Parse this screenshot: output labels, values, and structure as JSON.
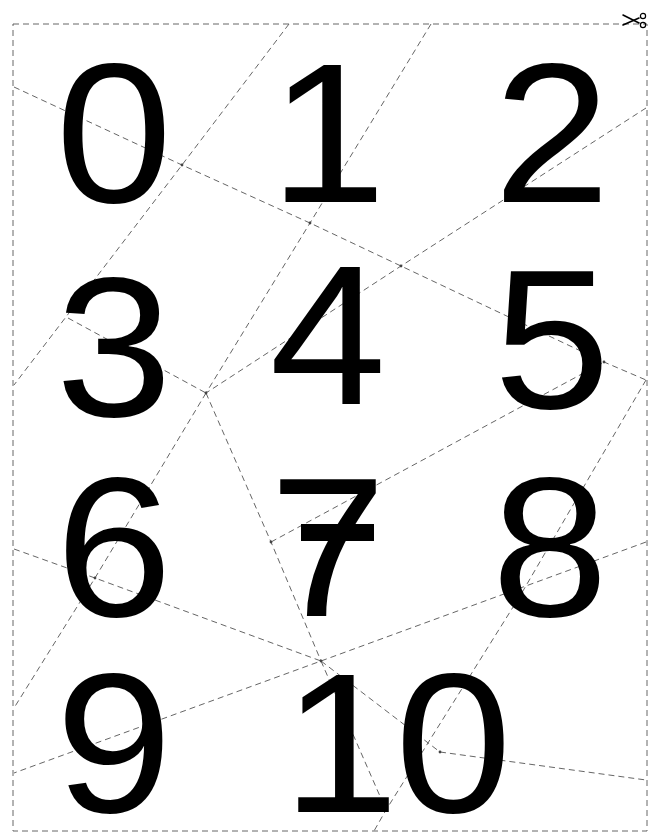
{
  "sheet": {
    "title": "Number cut-out sheet",
    "border_color": "#555555",
    "cut_line_color": "#777777",
    "ink_color": "#000000",
    "background": "#ffffff",
    "scissors_icon": "scissors-icon"
  },
  "digits": [
    {
      "id": "0",
      "label": "0"
    },
    {
      "id": "1",
      "label": "1"
    },
    {
      "id": "2",
      "label": "2"
    },
    {
      "id": "3",
      "label": "3"
    },
    {
      "id": "4",
      "label": "4"
    },
    {
      "id": "5",
      "label": "5"
    },
    {
      "id": "6",
      "label": "6"
    },
    {
      "id": "7",
      "label": "7"
    },
    {
      "id": "8",
      "label": "8"
    },
    {
      "id": "9",
      "label": "9"
    },
    {
      "id": "10",
      "label": "10"
    }
  ]
}
